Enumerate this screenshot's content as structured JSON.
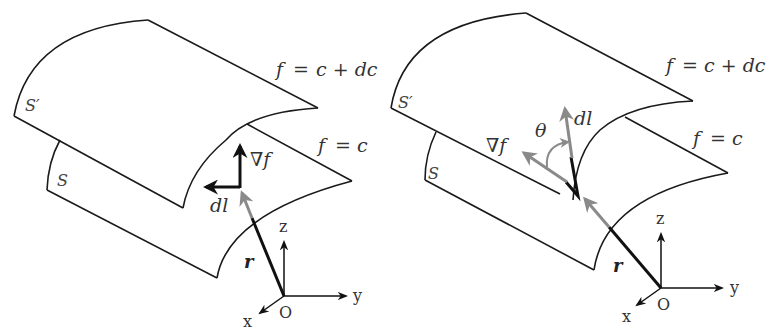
{
  "figure": {
    "panels": [
      {
        "id": "left",
        "surface_upper_label": "S′",
        "surface_lower_label": "S",
        "upper_eq": {
          "f": "f",
          "eq": "=",
          "rhs": "c + dc"
        },
        "lower_eq": {
          "f": "f",
          "eq": "=",
          "rhs": "c"
        },
        "gradient_label": "∇f",
        "dl_label": "dl",
        "r_label": "r",
        "axes": {
          "x": "x",
          "y": "y",
          "z": "z",
          "origin": "O"
        }
      },
      {
        "id": "right",
        "surface_upper_label": "S′",
        "surface_lower_label": "S",
        "upper_eq": {
          "f": "f",
          "eq": "=",
          "rhs": "c + dc"
        },
        "lower_eq": {
          "f": "f",
          "eq": "=",
          "rhs": "c"
        },
        "gradient_label": "∇f",
        "dl_label": "dl",
        "angle_label": "θ",
        "r_label": "r",
        "axes": {
          "x": "x",
          "y": "y",
          "z": "z",
          "origin": "O"
        }
      }
    ],
    "colors": {
      "line": "#1a1a1a",
      "vector_black": "#111111",
      "vector_gray": "#8a8a8a",
      "text": "#333333"
    }
  }
}
